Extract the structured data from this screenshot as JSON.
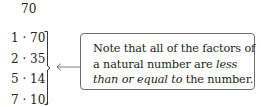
{
  "number": "70",
  "factor_pairs": [
    "1 · 70",
    "2 · 35",
    "5 · 14",
    "7 · 10."
  ],
  "note": {
    "line1": "Note that all of the factors of",
    "line2_plain": "a natural number are ",
    "line2_italic": "less",
    "line3_italic": "than or equal to",
    "line3_plain": " the number."
  },
  "colors": {
    "text": "#231f20",
    "border": "#6d6e71"
  }
}
